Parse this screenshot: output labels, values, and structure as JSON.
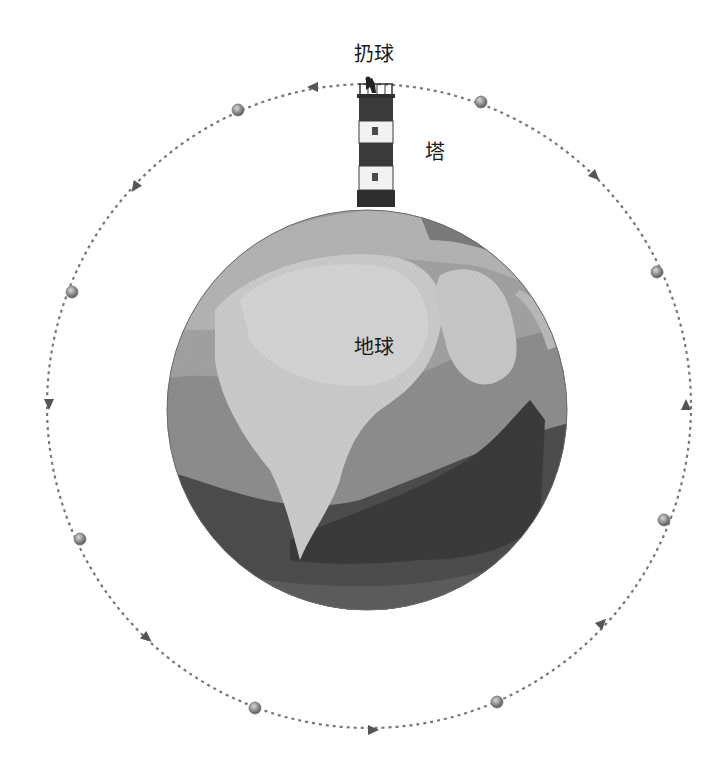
{
  "labels": {
    "throw": "扔球",
    "tower": "塔",
    "earth": "地球"
  },
  "orbit": {
    "center": [
      369,
      406
    ],
    "radius": 322,
    "stroke": "#777777",
    "balls": [
      [
        238,
        110
      ],
      [
        481,
        102
      ],
      [
        657,
        272
      ],
      [
        664,
        520
      ],
      [
        497,
        702
      ],
      [
        255,
        708
      ],
      [
        80,
        539
      ],
      [
        72,
        292
      ]
    ],
    "arrows": [
      {
        "x": 313,
        "y": 87,
        "angle": 180
      },
      {
        "x": 595,
        "y": 176,
        "angle": 45
      },
      {
        "x": 686,
        "y": 405,
        "angle": -90
      },
      {
        "x": 602,
        "y": 623,
        "angle": -45
      },
      {
        "x": 373,
        "y": 730,
        "angle": 0
      },
      {
        "x": 147,
        "y": 638,
        "angle": 40
      },
      {
        "x": 49,
        "y": 404,
        "angle": 90
      },
      {
        "x": 135,
        "y": 187,
        "angle": 125
      }
    ]
  },
  "earth": {
    "center": [
      367,
      410
    ],
    "radius": 200,
    "colors": {
      "ocean": "#9a9a9a",
      "land_light": "#c9c9c9",
      "land_mid": "#b0b0b0",
      "dark": "#4a4a4a",
      "darker": "#3c3c3c",
      "bottom": "#5c5c5c"
    }
  },
  "tower": {
    "x": 359,
    "width": 34,
    "top": 84,
    "bottom": 206,
    "colors": {
      "dark": "#3a3a3a",
      "light": "#f2f2f2"
    }
  }
}
